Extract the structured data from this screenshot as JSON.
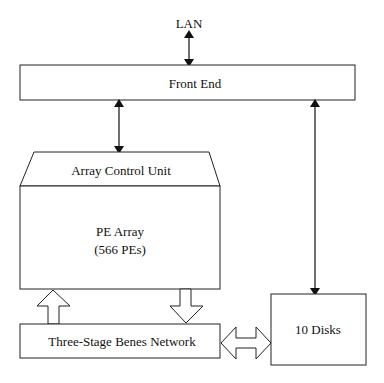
{
  "diagram": {
    "lan_label": "LAN",
    "front_end_label": "Front End",
    "array_control_unit_label": "Array Control Unit",
    "pe_array_label_line1": "PE Array",
    "pe_array_label_line2": "(566 PEs)",
    "benes_network_label": "Three-Stage Benes Network",
    "disks_label": "10 Disks",
    "colors": {
      "stroke": "#222222",
      "background": "#ffffff",
      "text": "#111111"
    }
  }
}
